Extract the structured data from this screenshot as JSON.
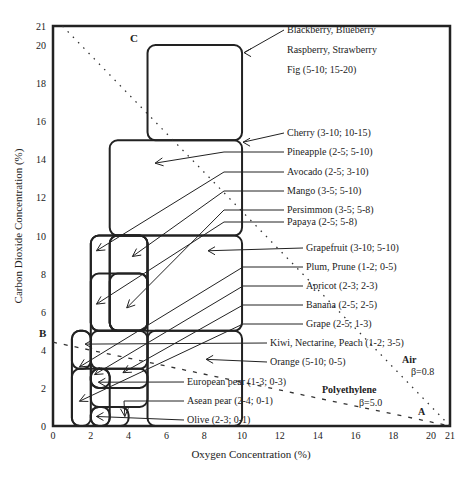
{
  "chart_data": {
    "type": "diagram-chart",
    "title": "",
    "xlabel": "Oxygen Concentration   (%)",
    "ylabel": "Carbon Dioxide Concentration (%)",
    "xlim": [
      0,
      21
    ],
    "ylim": [
      0,
      21
    ],
    "x_ticks": [
      "0",
      "2",
      "4",
      "6",
      "8",
      "10",
      "12",
      "14",
      "16",
      "18",
      "20",
      "21"
    ],
    "y_ticks": [
      "0",
      "2",
      "4",
      "6",
      "8",
      "10",
      "12",
      "14",
      "16",
      "18",
      "20",
      "21"
    ],
    "x_tick_values": [
      0,
      2,
      4,
      6,
      8,
      10,
      12,
      14,
      16,
      18,
      20,
      21
    ],
    "y_tick_values": [
      0,
      2,
      4,
      6,
      8,
      10,
      12,
      14,
      16,
      18,
      20,
      21
    ],
    "regions": [
      {
        "label": "Blackberry, Blueberry",
        "o2": [
          5,
          10
        ],
        "co2": [
          15,
          20
        ]
      },
      {
        "label": "Raspberry, Strawberry",
        "o2": [
          5,
          10
        ],
        "co2": [
          15,
          20
        ]
      },
      {
        "label": "Fig (5-10; 15-20)",
        "o2": [
          5,
          10
        ],
        "co2": [
          15,
          20
        ]
      },
      {
        "label": "Cherry (3-10; 10-15)",
        "o2": [
          3,
          10
        ],
        "co2": [
          10,
          15
        ]
      },
      {
        "label": "Pineapple (2-5; 5-10)",
        "o2": [
          2,
          5
        ],
        "co2": [
          5,
          10
        ]
      },
      {
        "label": "Avocado (2-5; 3-10)",
        "o2": [
          2,
          5
        ],
        "co2": [
          3,
          10
        ]
      },
      {
        "label": "Mango (3-5; 5-10)",
        "o2": [
          3,
          5
        ],
        "co2": [
          5,
          10
        ]
      },
      {
        "label": "Persimmon (3-5; 5-8)",
        "o2": [
          3,
          5
        ],
        "co2": [
          5,
          8
        ]
      },
      {
        "label": "Papaya (2-5; 5-8)",
        "o2": [
          2,
          5
        ],
        "co2": [
          5,
          8
        ]
      },
      {
        "label": "Grapefruit (3-10; 5-10)",
        "o2": [
          3,
          10
        ],
        "co2": [
          5,
          10
        ]
      },
      {
        "label": "Plum, Prune (1-2; 0-5)",
        "o2": [
          1,
          2
        ],
        "co2": [
          0,
          5
        ]
      },
      {
        "label": "Apricot (2-3; 2-3)",
        "o2": [
          2,
          3
        ],
        "co2": [
          2,
          3
        ]
      },
      {
        "label": "Banana (2-5; 2-5)",
        "o2": [
          2,
          5
        ],
        "co2": [
          2,
          5
        ]
      },
      {
        "label": "Grape (2-5; 1-3)",
        "o2": [
          2,
          5
        ],
        "co2": [
          1,
          3
        ]
      },
      {
        "label": "Kiwi, Nectarine, Peach (1-2; 3-5)",
        "o2": [
          1,
          2
        ],
        "co2": [
          3,
          5
        ]
      },
      {
        "label": "Orange (5-10; 0-5)",
        "o2": [
          5,
          10
        ],
        "co2": [
          0,
          5
        ]
      },
      {
        "label": "European pear (1-3; 0-3)",
        "o2": [
          1,
          3
        ],
        "co2": [
          0,
          3
        ]
      },
      {
        "label": "Asean pear (2-4; 0-1)",
        "o2": [
          2,
          4
        ],
        "co2": [
          0,
          1
        ]
      },
      {
        "label": "Olive (2-3; 0-1)",
        "o2": [
          2,
          3
        ],
        "co2": [
          0,
          1
        ]
      }
    ],
    "lines": [
      {
        "name": "Air",
        "beta": "β=0.8",
        "from_label": "C",
        "to_label": "A",
        "from": [
          0.5,
          21
        ],
        "to": [
          21,
          0
        ],
        "style": "dotted"
      },
      {
        "name": "Polyethylene",
        "beta": "β=5.0",
        "from_label": "B",
        "to_label": "A",
        "from": [
          0,
          4.4
        ],
        "to": [
          21,
          0
        ],
        "style": "dashed"
      }
    ],
    "point_labels": [
      "A",
      "B",
      "C"
    ],
    "annotations": [
      "Air",
      "β=0.8",
      "Polyethylene",
      "β=5.0"
    ],
    "grid": false,
    "legend": "none"
  },
  "labels": {
    "pointC": "C",
    "pointB": "B",
    "pointA": "A",
    "air": "Air",
    "airBeta": "β=0.8",
    "poly": "Polyethylene",
    "polyBeta": "β=5.0"
  }
}
